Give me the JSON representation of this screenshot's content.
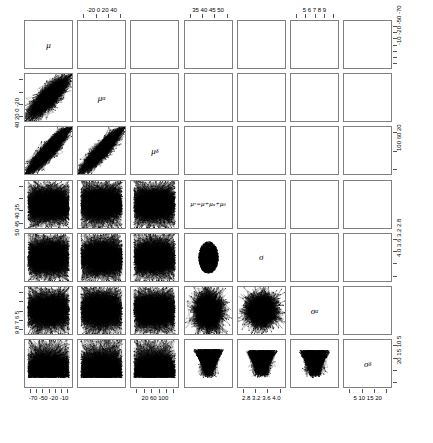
{
  "figure": {
    "type": "pairs-scatterplot-matrix",
    "n_variables": 7,
    "background_color": "#ffffff",
    "point_color": "#000000",
    "frame_color": "#808080"
  },
  "variables": [
    {
      "key": "mu",
      "label_html": "μ",
      "plain": "mu"
    },
    {
      "key": "mu_alpha",
      "label_html": "μ<sub>α</sub>",
      "plain": "mu_alpha"
    },
    {
      "key": "mu_delta",
      "label_html": "μ<sub>δ</sub>",
      "plain": "mu_delta"
    },
    {
      "key": "mu_star",
      "label_html": "μ<sup>*</sup>=μ+μ<sub>α</sub>+μ<sub>δ</sub>",
      "plain": "mu* = mu + mu_alpha + mu_delta"
    },
    {
      "key": "sigma",
      "label_html": "σ",
      "plain": "sigma"
    },
    {
      "key": "sigma_alpha",
      "label_html": "σ<sub>α</sub>",
      "plain": "sigma_alpha"
    },
    {
      "key": "sigma_delta",
      "label_html": "σ<sub>δ</sub>",
      "plain": "sigma_delta"
    }
  ],
  "axes": {
    "top": [
      {
        "column": 2,
        "labels": [
          "-20",
          "0",
          "20",
          "40"
        ],
        "ticks": [
          -20,
          0,
          20,
          40
        ]
      },
      {
        "column": 4,
        "labels": [
          "35",
          "40",
          "45",
          "50"
        ],
        "ticks": [
          35,
          40,
          45,
          50
        ]
      },
      {
        "column": 6,
        "labels": [
          "5",
          "6",
          "7",
          "8",
          "9"
        ],
        "ticks": [
          5,
          6,
          7,
          8,
          9
        ]
      }
    ],
    "bottom": [
      {
        "column": 1,
        "labels": [
          "-70",
          "-50",
          "-20",
          "-10"
        ],
        "ticks": [
          -70,
          -60,
          -50,
          -40,
          -30,
          -20,
          -10
        ]
      },
      {
        "column": 3,
        "labels": [
          "20",
          "60",
          "100"
        ],
        "ticks": [
          20,
          40,
          60,
          80,
          100,
          120
        ]
      },
      {
        "column": 5,
        "labels": [
          "2.8",
          "3.2",
          "3.6",
          "4.0"
        ],
        "ticks": [
          2.8,
          3.2,
          3.6,
          4.0
        ]
      },
      {
        "column": 7,
        "labels": [
          "5",
          "10",
          "15",
          "20"
        ],
        "ticks": [
          5,
          10,
          15,
          20
        ]
      }
    ],
    "left": [
      {
        "row": 2,
        "labels": [
          "-20",
          "0",
          "20",
          "40"
        ],
        "ticks": [
          -20,
          0,
          20,
          40
        ]
      },
      {
        "row": 4,
        "labels": [
          "35",
          "40",
          "45",
          "50"
        ],
        "ticks": [
          35,
          40,
          45,
          50
        ]
      },
      {
        "row": 6,
        "labels": [
          "5",
          "6",
          "7",
          "8",
          "9"
        ],
        "ticks": [
          5,
          6,
          7,
          8,
          9
        ]
      }
    ],
    "right": [
      {
        "row": 1,
        "labels": [
          "-70",
          "-50",
          "-20",
          "-10"
        ],
        "ticks": [
          -70,
          -60,
          -50,
          -40,
          -30,
          -20,
          -10
        ]
      },
      {
        "row": 3,
        "labels": [
          "20",
          "60",
          "100"
        ],
        "ticks": [
          20,
          60,
          100
        ]
      },
      {
        "row": 5,
        "labels": [
          "2.8",
          "3.2",
          "3.6",
          "4.0"
        ],
        "ticks": [
          2.8,
          3.2,
          3.6,
          4.0
        ]
      },
      {
        "row": 7,
        "labels": [
          "5",
          "10",
          "15",
          "20"
        ],
        "ticks": [
          5,
          10,
          15,
          20
        ]
      }
    ]
  },
  "chart_data": {
    "type": "scatter",
    "title": "",
    "xlabel": "",
    "ylabel": "",
    "grid": false,
    "legend": null,
    "matrix_size": 7,
    "diagonal_labels": [
      "μ",
      "μ_α",
      "μ_δ",
      "μ* = μ + μ_α + μ_δ",
      "σ",
      "σ_α",
      "σ_δ"
    ],
    "variable_ranges": [
      {
        "name": "mu",
        "min": -75,
        "max": -5,
        "ticks": [
          -70,
          -60,
          -50,
          -40,
          -30,
          -20,
          -10
        ]
      },
      {
        "name": "mu_alpha",
        "min": -32,
        "max": 48,
        "ticks": [
          -20,
          0,
          20,
          40
        ]
      },
      {
        "name": "mu_delta",
        "min": 10,
        "max": 125,
        "ticks": [
          20,
          60,
          100
        ]
      },
      {
        "name": "mu_star",
        "min": 33,
        "max": 52,
        "ticks": [
          35,
          40,
          45,
          50
        ]
      },
      {
        "name": "sigma",
        "min": 2.6,
        "max": 4.2,
        "ticks": [
          2.8,
          3.2,
          3.6,
          4.0
        ]
      },
      {
        "name": "sigma_alpha",
        "min": 4.3,
        "max": 9.6,
        "ticks": [
          5,
          6,
          7,
          8,
          9
        ]
      },
      {
        "name": "sigma_delta",
        "min": 3,
        "max": 22,
        "ticks": [
          5,
          10,
          15,
          20
        ]
      }
    ],
    "scatter_panels": [
      {
        "row": 2,
        "col": 1,
        "x": "mu",
        "y": "mu_alpha",
        "pattern": "strong-negative-blob",
        "correlation": -0.75,
        "n_points": 4000
      },
      {
        "row": 3,
        "col": 1,
        "x": "mu",
        "y": "mu_delta",
        "pattern": "strong-negative-band",
        "correlation": -0.82,
        "n_points": 4000
      },
      {
        "row": 3,
        "col": 2,
        "x": "mu_alpha",
        "y": "mu_delta",
        "pattern": "strong-negative-band",
        "correlation": -0.78,
        "n_points": 4000
      },
      {
        "row": 4,
        "col": 1,
        "x": "mu",
        "y": "mu_star",
        "pattern": "uniform-dense",
        "correlation": 0.02,
        "n_points": 4000
      },
      {
        "row": 4,
        "col": 2,
        "x": "mu_alpha",
        "y": "mu_star",
        "pattern": "uniform-dense",
        "correlation": 0.01,
        "n_points": 4000
      },
      {
        "row": 4,
        "col": 3,
        "x": "mu_delta",
        "y": "mu_star",
        "pattern": "uniform-dense",
        "correlation": 0.0,
        "n_points": 4000
      },
      {
        "row": 5,
        "col": 1,
        "x": "mu",
        "y": "sigma",
        "pattern": "uniform-dense",
        "correlation": 0.0,
        "n_points": 4000
      },
      {
        "row": 5,
        "col": 2,
        "x": "mu_alpha",
        "y": "sigma",
        "pattern": "uniform-dense",
        "correlation": 0.0,
        "n_points": 4000
      },
      {
        "row": 5,
        "col": 3,
        "x": "mu_delta",
        "y": "sigma",
        "pattern": "uniform-dense",
        "correlation": 0.0,
        "n_points": 4000
      },
      {
        "row": 5,
        "col": 4,
        "x": "mu_star",
        "y": "sigma",
        "pattern": "star-burst",
        "correlation": 0.0,
        "n_points": 4000
      },
      {
        "row": 6,
        "col": 1,
        "x": "mu",
        "y": "sigma_alpha",
        "pattern": "uniform-dense",
        "correlation": 0.0,
        "n_points": 4000
      },
      {
        "row": 6,
        "col": 2,
        "x": "mu_alpha",
        "y": "sigma_alpha",
        "pattern": "uniform-dense",
        "correlation": 0.0,
        "n_points": 4000
      },
      {
        "row": 6,
        "col": 3,
        "x": "mu_delta",
        "y": "sigma_alpha",
        "pattern": "uniform-dense",
        "correlation": 0.0,
        "n_points": 4000
      },
      {
        "row": 6,
        "col": 4,
        "x": "mu_star",
        "y": "sigma_alpha",
        "pattern": "vertical-spike",
        "correlation": 0.0,
        "n_points": 4000
      },
      {
        "row": 6,
        "col": 5,
        "x": "sigma",
        "y": "sigma_alpha",
        "pattern": "round-blob",
        "correlation": 0.05,
        "n_points": 4000
      },
      {
        "row": 7,
        "col": 1,
        "x": "mu",
        "y": "sigma_delta",
        "pattern": "uniform-dense-bottom",
        "correlation": 0.0,
        "n_points": 4000
      },
      {
        "row": 7,
        "col": 2,
        "x": "mu_alpha",
        "y": "sigma_delta",
        "pattern": "uniform-dense-bottom",
        "correlation": 0.0,
        "n_points": 4000
      },
      {
        "row": 7,
        "col": 3,
        "x": "mu_delta",
        "y": "sigma_delta",
        "pattern": "uniform-dense-bottom",
        "correlation": 0.0,
        "n_points": 4000
      },
      {
        "row": 7,
        "col": 4,
        "x": "mu_star",
        "y": "sigma_delta",
        "pattern": "downward-wedge",
        "correlation": 0.0,
        "n_points": 4000
      },
      {
        "row": 7,
        "col": 5,
        "x": "sigma",
        "y": "sigma_delta",
        "pattern": "upward-wedge",
        "correlation": 0.0,
        "n_points": 4000
      },
      {
        "row": 7,
        "col": 6,
        "x": "sigma_alpha",
        "y": "sigma_delta",
        "pattern": "upward-wedge",
        "correlation": 0.0,
        "n_points": 4000
      }
    ]
  }
}
